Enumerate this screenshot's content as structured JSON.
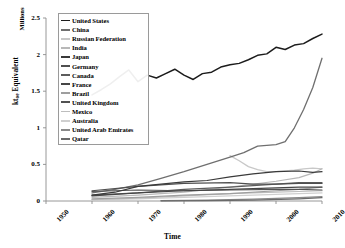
{
  "chart_data": {
    "type": "line",
    "title": "",
    "xlabel": "Time",
    "ylabel": "kt_oe Equivalent",
    "ylabel_main": "kt",
    "ylabel_sub": "oe",
    "ylabel_rest": " Equivalent",
    "units_label": "Millions",
    "xlim": [
      1950,
      2010
    ],
    "ylim": [
      0,
      2.5
    ],
    "yticks": [
      "0",
      "0.5",
      "1",
      "1.5",
      "2",
      "2.5"
    ],
    "ytick_values": [
      0,
      0.5,
      1,
      1.5,
      2,
      2.5
    ],
    "xticks": [
      "1950",
      "1960",
      "1970",
      "1980",
      "1990",
      "2000",
      "2010"
    ],
    "xtick_values": [
      1950,
      1960,
      1970,
      1980,
      1990,
      2000,
      2010
    ],
    "grid": false,
    "legend_position": "top-left-inside",
    "series": [
      {
        "name": "United States",
        "color": "#1c1c1c",
        "width": 1.5,
        "x": [
          1960,
          1962,
          1964,
          1966,
          1968,
          1970,
          1972,
          1974,
          1976,
          1978,
          1980,
          1982,
          1984,
          1986,
          1988,
          1990,
          1992,
          1994,
          1996,
          1998,
          2000,
          2002,
          2004,
          2006,
          2008,
          2010
        ],
        "values": [
          1.45,
          1.52,
          1.6,
          1.7,
          1.79,
          1.63,
          1.72,
          1.68,
          1.74,
          1.8,
          1.72,
          1.66,
          1.74,
          1.76,
          1.83,
          1.86,
          1.88,
          1.93,
          1.99,
          2.01,
          2.1,
          2.07,
          2.13,
          2.15,
          2.22,
          2.28
        ]
      },
      {
        "name": "China",
        "color": "#6f6f6f",
        "width": 1.3,
        "x": [
          1960,
          1965,
          1970,
          1975,
          1980,
          1985,
          1990,
          1993,
          1996,
          1998,
          2000,
          2002,
          2004,
          2006,
          2008,
          2010
        ],
        "values": [
          0.11,
          0.16,
          0.22,
          0.31,
          0.4,
          0.5,
          0.6,
          0.66,
          0.75,
          0.76,
          0.77,
          0.81,
          1.0,
          1.25,
          1.55,
          1.95
        ]
      },
      {
        "name": "Russian Federation",
        "color": "#c8c8c8",
        "width": 1.3,
        "x": [
          1990,
          1992,
          1994,
          1996,
          1998,
          2000,
          2002,
          2004,
          2006,
          2008,
          2010
        ],
        "values": [
          0.62,
          0.55,
          0.47,
          0.43,
          0.4,
          0.4,
          0.41,
          0.42,
          0.44,
          0.45,
          0.44
        ]
      },
      {
        "name": "India",
        "color": "#b8b8b8",
        "width": 1.2,
        "x": [
          1960,
          1970,
          1980,
          1990,
          2000,
          2005,
          2008,
          2010
        ],
        "values": [
          0.05,
          0.08,
          0.12,
          0.19,
          0.27,
          0.32,
          0.38,
          0.44
        ]
      },
      {
        "name": "Japan",
        "color": "#3a3a3a",
        "width": 1.2,
        "x": [
          1960,
          1965,
          1970,
          1975,
          1980,
          1985,
          1990,
          1995,
          2000,
          2005,
          2008,
          2010
        ],
        "values": [
          0.08,
          0.12,
          0.2,
          0.23,
          0.26,
          0.28,
          0.33,
          0.37,
          0.4,
          0.41,
          0.39,
          0.4
        ]
      },
      {
        "name": "Germany",
        "color": "#4f4f4f",
        "width": 1.2,
        "x": [
          1960,
          1970,
          1980,
          1990,
          1995,
          2000,
          2005,
          2010
        ],
        "values": [
          0.14,
          0.2,
          0.24,
          0.25,
          0.23,
          0.23,
          0.24,
          0.24
        ]
      },
      {
        "name": "Canada",
        "color": "#5c5c5c",
        "width": 1.2,
        "x": [
          1960,
          1970,
          1980,
          1990,
          2000,
          2005,
          2010
        ],
        "values": [
          0.08,
          0.11,
          0.16,
          0.19,
          0.23,
          0.25,
          0.25
        ]
      },
      {
        "name": "France",
        "color": "#454545",
        "width": 1.2,
        "x": [
          1960,
          1970,
          1980,
          1990,
          2000,
          2005,
          2010
        ],
        "values": [
          0.07,
          0.11,
          0.14,
          0.16,
          0.18,
          0.19,
          0.19
        ]
      },
      {
        "name": "Brazil",
        "color": "#9e9e9e",
        "width": 1.2,
        "x": [
          1960,
          1970,
          1980,
          1990,
          2000,
          2005,
          2010
        ],
        "values": [
          0.03,
          0.05,
          0.08,
          0.1,
          0.14,
          0.16,
          0.19
        ]
      },
      {
        "name": "United Kingdom",
        "color": "#525252",
        "width": 1.2,
        "x": [
          1960,
          1970,
          1980,
          1990,
          2000,
          2005,
          2010
        ],
        "values": [
          0.13,
          0.15,
          0.14,
          0.15,
          0.16,
          0.16,
          0.15
        ]
      },
      {
        "name": "Mexico",
        "color": "#bdbdbd",
        "width": 1.2,
        "x": [
          1960,
          1970,
          1980,
          1990,
          2000,
          2005,
          2010
        ],
        "values": [
          0.02,
          0.04,
          0.07,
          0.1,
          0.12,
          0.13,
          0.14
        ]
      },
      {
        "name": "Australia",
        "color": "#cfcfcf",
        "width": 1.2,
        "x": [
          1960,
          1970,
          1980,
          1990,
          2000,
          2005,
          2010
        ],
        "values": [
          0.02,
          0.03,
          0.05,
          0.07,
          0.09,
          0.1,
          0.11
        ]
      },
      {
        "name": "United Arab Emirates",
        "color": "#8a8a8a",
        "width": 1.2,
        "x": [
          1975,
          1985,
          1995,
          2005,
          2010
        ],
        "values": [
          0.005,
          0.012,
          0.025,
          0.045,
          0.06
        ]
      },
      {
        "name": "Qatar",
        "color": "#6a6a6a",
        "width": 1.2,
        "x": [
          1975,
          1985,
          1995,
          2005,
          2010
        ],
        "values": [
          0.002,
          0.005,
          0.012,
          0.03,
          0.045
        ]
      }
    ]
  },
  "legend": {
    "items": [
      {
        "label": "United States"
      },
      {
        "label": "China"
      },
      {
        "label": "Russian Federation"
      },
      {
        "label": "India"
      },
      {
        "label": "Japan"
      },
      {
        "label": "Germany"
      },
      {
        "label": "Canada"
      },
      {
        "label": "France"
      },
      {
        "label": "Brazil"
      },
      {
        "label": "United Kingdom"
      },
      {
        "label": "Mexico"
      },
      {
        "label": "Australia"
      },
      {
        "label": "United Arab Emirates"
      },
      {
        "label": "Qatar"
      }
    ]
  },
  "colors": {
    "axis": "#8c8c8c",
    "text": "#1a1a1a",
    "legend_border": "#9a9a9a",
    "background": "#ffffff"
  }
}
